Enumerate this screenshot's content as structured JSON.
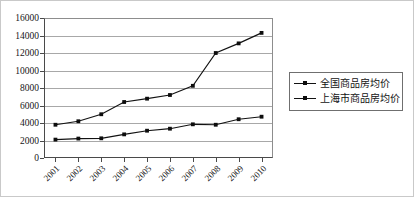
{
  "chart_data": {
    "type": "line",
    "title": "",
    "subtitle": "",
    "xlabel": "",
    "ylabel": "",
    "categories": [
      "2001",
      "2002",
      "2003",
      "2004",
      "2005",
      "2006",
      "2007",
      "2008",
      "2009",
      "2010"
    ],
    "ylim": [
      0,
      16000
    ],
    "ytick_values": [
      0,
      2000,
      4000,
      6000,
      8000,
      10000,
      12000,
      14000,
      16000
    ],
    "ytick_labels": [
      "0",
      "2000",
      "4000",
      "6000",
      "8000",
      "10000",
      "12000",
      "14000",
      "16000"
    ],
    "grid": true,
    "grid_axis": "y",
    "legend_position": "right",
    "series": [
      {
        "name": "全国商品房均价",
        "marker": "square",
        "color": "#121212",
        "values": [
          2100,
          2220,
          2250,
          2700,
          3120,
          3350,
          3850,
          3800,
          4430,
          4720
        ]
      },
      {
        "name": "上海市商品房均价",
        "marker": "square",
        "color": "#121212",
        "values": [
          3800,
          4200,
          5000,
          6400,
          6780,
          7200,
          8250,
          12000,
          13100,
          14300
        ]
      }
    ]
  },
  "legend": {
    "items": [
      {
        "label": "全国商品房均价"
      },
      {
        "label": "上海市商品房均价"
      }
    ]
  }
}
